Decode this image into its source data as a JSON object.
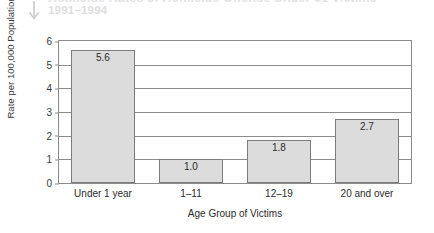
{
  "header": {
    "title": "Homicide Rates of Homicide Offense Under 61 Victims",
    "subtitle": "1991–1994",
    "arrow_icon": "down-arrow-icon"
  },
  "chart_data": {
    "type": "bar",
    "title": "",
    "xlabel": "Age Group of Victims",
    "ylabel": "Rate per 100,000 Population",
    "categories": [
      "Under 1 year",
      "1–11",
      "12–19",
      "20 and over"
    ],
    "values": [
      5.6,
      1.0,
      1.8,
      2.7
    ],
    "value_labels": [
      "5.6",
      "1.0",
      "1.8",
      "2.7"
    ],
    "ylim": [
      0,
      6
    ],
    "yticks": [
      0,
      1,
      2,
      3,
      4,
      5,
      6
    ],
    "ytick_labels": [
      "0",
      "1",
      "2",
      "3",
      "4",
      "5",
      "6"
    ],
    "grid": true,
    "legend": false,
    "bar_color": "#dcdcdc",
    "bar_border_color": "#7d7d7d",
    "axis_color": "#8c8c8c",
    "background": "#ffffff"
  }
}
